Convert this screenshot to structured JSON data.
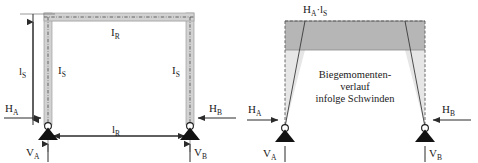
{
  "figure": {
    "type": "structural-engineering-diagram",
    "colors": {
      "member_fill": "#d0d0d0",
      "member_outline": "#9a9a9a",
      "centerline": "#4a4a4a",
      "moment_dark": "#b6b6b6",
      "moment_light": "#e4e4e4",
      "ink": "#1a1a1a",
      "arrow": "#2b2b2b",
      "background": "#ffffff"
    }
  },
  "left_diagram": {
    "name": "portal-frame-system",
    "labels": {
      "column_height_dim": {
        "base": "l",
        "sub": "S"
      },
      "left_column_member": {
        "base": "I",
        "sub": "S"
      },
      "right_column_member": {
        "base": "I",
        "sub": "S"
      },
      "beam_member": {
        "base": "I",
        "sub": "R"
      },
      "span_dim": {
        "base": "l",
        "sub": "R"
      },
      "reaction_HA": {
        "base": "H",
        "sub": "A"
      },
      "reaction_HB": {
        "base": "H",
        "sub": "B"
      },
      "reaction_VA": {
        "base": "V",
        "sub": "A"
      },
      "reaction_VB": {
        "base": "V",
        "sub": "B"
      }
    },
    "supports": [
      {
        "name": "support-a",
        "type": "pinned"
      },
      {
        "name": "support-b",
        "type": "pinned"
      }
    ]
  },
  "right_diagram": {
    "name": "bending-moment-diagram",
    "labels": {
      "moment_value": {
        "base": "H",
        "sub": "A",
        "mid": "·l",
        "sub2": "S"
      },
      "caption_line1": "Biegemomenten-",
      "caption_line2": "verlauf",
      "caption_line3": "infolge Schwinden",
      "reaction_HA": {
        "base": "H",
        "sub": "A"
      },
      "reaction_HB": {
        "base": "H",
        "sub": "B"
      },
      "reaction_VA": {
        "base": "V",
        "sub": "A"
      },
      "reaction_VB": {
        "base": "V",
        "sub": "B"
      }
    },
    "supports": [
      {
        "name": "support-a",
        "type": "pinned"
      },
      {
        "name": "support-b",
        "type": "pinned"
      }
    ]
  }
}
